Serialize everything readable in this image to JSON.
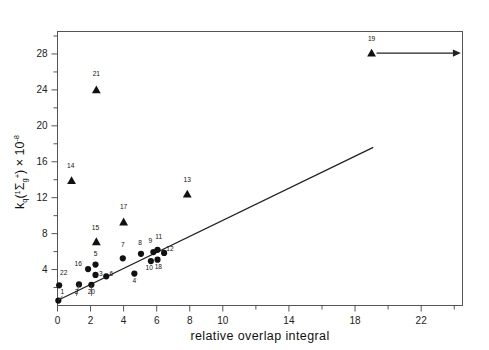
{
  "chart_data": {
    "type": "scatter",
    "title": "",
    "xlabel": "relative overlap integral",
    "ylabel": "kq(1Sigma g+) x 10^-8",
    "ylabel_parts": {
      "k": "k",
      "k_sub": "q",
      "paren_open": "(",
      "sigma_sup": "1",
      "sigma": "Σ",
      "sigma_sub": "g",
      "sigma_plus": "+",
      "paren_close": ")",
      "times": " × ",
      "ten": "10",
      "exp": "-8"
    },
    "xlim": [
      0,
      24.5
    ],
    "ylim": [
      0,
      30.5
    ],
    "xticks_major": [
      0,
      2,
      4,
      6,
      8,
      10,
      14,
      18,
      22
    ],
    "xticks_all": [
      0,
      2,
      4,
      6,
      8,
      10,
      12,
      14,
      16,
      18,
      20,
      22,
      24
    ],
    "xticklabels": [
      "0",
      "2",
      "4",
      "6",
      "8",
      "10",
      "",
      "14",
      "",
      "18",
      "",
      "22",
      ""
    ],
    "yticks_major": [
      4,
      8,
      12,
      16,
      20,
      24,
      28
    ],
    "yticks_all": [
      2,
      4,
      6,
      8,
      10,
      12,
      14,
      16,
      18,
      20,
      22,
      24,
      26,
      28,
      30
    ],
    "yticklabels": [
      "4",
      "8",
      "12",
      "16",
      "20",
      "24",
      "28"
    ],
    "grid": false,
    "legend": false,
    "series": [
      {
        "name": "circles",
        "marker": "filled-circle",
        "points": [
          {
            "label": "1",
            "x": 0.05,
            "y": 0.55,
            "lx": 0.3,
            "ly": 1.3,
            "leader": true
          },
          {
            "label": "22",
            "x": 0.1,
            "y": 2.25,
            "lx": 0.38,
            "ly": 3.35,
            "leader": false
          },
          {
            "label": "2",
            "x": 1.3,
            "y": 2.35,
            "lx": 1.15,
            "ly": 1.3,
            "leader": true
          },
          {
            "label": "20",
            "x": 2.05,
            "y": 2.3,
            "lx": 2.05,
            "ly": 1.3,
            "leader": true
          },
          {
            "label": "16",
            "x": 1.85,
            "y": 4.05,
            "lx": 1.25,
            "ly": 4.35,
            "leader": false
          },
          {
            "label": "5",
            "x": 2.3,
            "y": 4.55,
            "lx": 2.3,
            "ly": 5.5,
            "leader": false
          },
          {
            "label": "3",
            "x": 2.3,
            "y": 3.4,
            "lx": 2.62,
            "ly": 3.3,
            "leader": false
          },
          {
            "label": "6",
            "x": 2.95,
            "y": 3.25,
            "lx": 3.25,
            "ly": 3.25,
            "leader": false
          },
          {
            "label": "7",
            "x": 3.95,
            "y": 5.25,
            "lx": 3.95,
            "ly": 6.5,
            "leader": false
          },
          {
            "label": "4",
            "x": 4.65,
            "y": 3.55,
            "lx": 4.65,
            "ly": 2.55,
            "leader": false
          },
          {
            "label": "8",
            "x": 5.05,
            "y": 5.75,
            "lx": 5.0,
            "ly": 6.75,
            "leader": false
          },
          {
            "label": "9",
            "x": 5.8,
            "y": 5.95,
            "lx": 5.62,
            "ly": 7.0,
            "leader": false
          },
          {
            "label": "11",
            "x": 6.05,
            "y": 6.2,
            "lx": 6.12,
            "ly": 7.35,
            "leader": false
          },
          {
            "label": "12",
            "x": 6.45,
            "y": 5.85,
            "lx": 6.8,
            "ly": 6.1,
            "leader": false
          },
          {
            "label": "10",
            "x": 5.65,
            "y": 4.95,
            "lx": 5.55,
            "ly": 3.95,
            "leader": false
          },
          {
            "label": "18",
            "x": 6.05,
            "y": 5.1,
            "lx": 6.1,
            "ly": 4.1,
            "leader": false
          }
        ]
      },
      {
        "name": "triangles",
        "marker": "filled-triangle",
        "points": [
          {
            "label": "14",
            "x": 0.85,
            "y": 13.9,
            "lx": 0.8,
            "ly": 15.3,
            "leader": false
          },
          {
            "label": "21",
            "x": 2.35,
            "y": 24.0,
            "lx": 2.35,
            "ly": 25.6,
            "leader": false
          },
          {
            "label": "15",
            "x": 2.35,
            "y": 7.1,
            "lx": 2.3,
            "ly": 8.45,
            "leader": false
          },
          {
            "label": "17",
            "x": 4.0,
            "y": 9.3,
            "lx": 4.0,
            "ly": 10.7,
            "leader": false
          },
          {
            "label": "13",
            "x": 7.85,
            "y": 12.4,
            "lx": 7.85,
            "ly": 13.8,
            "leader": false
          },
          {
            "label": "19",
            "x": 19.0,
            "y": 28.1,
            "lx": 19.0,
            "ly": 29.4,
            "leader": false
          }
        ]
      }
    ],
    "fit_line": {
      "x1": 0.0,
      "y1": 0.55,
      "x2": 19.1,
      "y2": 17.6
    },
    "annotations": [
      {
        "type": "arrow",
        "label": "19",
        "x1": 19.3,
        "y1": 28.1,
        "x2": 24.4,
        "y2": 28.1,
        "note": "rightward arrow from point 19 indicating value beyond axis"
      }
    ]
  },
  "colors": {
    "ink": "#111111",
    "axis": "#555555",
    "background": "#ffffff"
  }
}
